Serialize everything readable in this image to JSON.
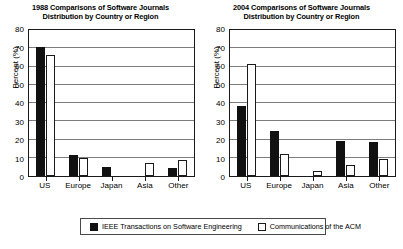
{
  "legend": {
    "entries": [
      {
        "label": "IEEE Transactions on Software Engineering",
        "swatch": "filled-black-square",
        "color": "#111111"
      },
      {
        "label": "Communications of the ACM",
        "swatch": "outlined-white-square",
        "color": "#ffffff"
      }
    ]
  },
  "chart_data": [
    {
      "type": "bar",
      "title": "1988 Comparisons of Software Journals Distribution by Country or Region",
      "title_line1": "1988 Comparisons of Software Journals",
      "title_line2": "Distribution by Country or Region",
      "xlabel": "",
      "ylabel": "Percent (%)",
      "ylim": [
        0,
        80
      ],
      "yticks": [
        0,
        10,
        20,
        30,
        40,
        50,
        60,
        70,
        80
      ],
      "grid": true,
      "legend_position": "bottom-shared",
      "categories": [
        "US",
        "Europe",
        "Japan",
        "Asia",
        "Other"
      ],
      "series": [
        {
          "name": "IEEE Transactions on Software Engineering",
          "values": [
            70,
            11,
            4.5,
            0,
            4
          ]
        },
        {
          "name": "Communications of the ACM",
          "values": [
            66,
            9.5,
            0,
            6.5,
            8.5
          ]
        }
      ]
    },
    {
      "type": "bar",
      "title": "2004 Comparisons of Software Journals Distribution by Country or Region",
      "title_line1": "2004 Comparisons of Software Journals",
      "title_line2": "Distribution by Country or Region",
      "xlabel": "",
      "ylabel": "Percent (%)",
      "ylim": [
        0,
        80
      ],
      "yticks": [
        0,
        10,
        20,
        30,
        40,
        50,
        60,
        70,
        80
      ],
      "grid": true,
      "legend_position": "bottom-shared",
      "categories": [
        "US",
        "Europe",
        "Japan",
        "Asia",
        "Other"
      ],
      "series": [
        {
          "name": "IEEE Transactions on Software Engineering",
          "values": [
            38,
            24,
            0,
            18.5,
            18
          ]
        },
        {
          "name": "Communications of the ACM",
          "values": [
            61,
            11.5,
            2,
            5.5,
            9
          ]
        }
      ]
    }
  ]
}
